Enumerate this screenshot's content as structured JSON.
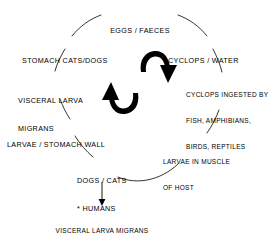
{
  "diagram": {
    "type": "cycle-diagram",
    "background_color": "#ffffff",
    "ink_color": "#000000",
    "nodes": [
      {
        "id": "eggs-faeces",
        "label": "EGGS / FAECES",
        "lines": [
          "EGGS / FAECES"
        ],
        "position": "top-center"
      },
      {
        "id": "cyclops-water",
        "label": "CYCLOPS / WATER",
        "lines": [
          "CYCLOPS / WATER"
        ],
        "position": "upper-right"
      },
      {
        "id": "cyclops-ingested",
        "label": "CYCLOPS INGESTED BY FISH, AMPHIBIANS, BIRDS, REPTILES",
        "lines": [
          "CYCLOPS INGESTED BY",
          "FISH, AMPHIBIANS,",
          "BIRDS, REPTILES"
        ],
        "position": "right"
      },
      {
        "id": "larvae-muscle",
        "label": "LARVAE IN MUSCLE OF HOST",
        "lines": [
          "LARVAE IN MUSCLE",
          "OF HOST"
        ],
        "position": "lower-right"
      },
      {
        "id": "dogs-cats-humans",
        "label": "DOGS / CATS * HUMANS",
        "lines": [
          "DOGS / CATS",
          "* HUMANS"
        ],
        "position": "bottom-center"
      },
      {
        "id": "larvae-stomach-wall",
        "label": "LARVAE / STOMACH WALL",
        "lines": [
          "LARVAE / STOMACH WALL"
        ],
        "position": "lower-left"
      },
      {
        "id": "visceral-larva-migrans",
        "label": "VISCERAL LARVA MIGRANS",
        "lines": [
          "VISCERAL LARVA",
          "MIGRANS"
        ],
        "position": "left"
      },
      {
        "id": "stomach-cats-dogs",
        "label": "STOMACH CATS/DOGS",
        "lines": [
          "STOMACH CATS/DOGS"
        ],
        "position": "upper-left"
      }
    ],
    "outcome": {
      "id": "dead-end-outcome",
      "lines": [
        "VISCERAL LARVA MIGRANS",
        "* \"DEAD END\""
      ],
      "line1": "VISCERAL LARVA MIGRANS",
      "line2": "* \"DEAD END\"",
      "position": "below-bottom-center"
    },
    "rotation_arrows": {
      "name": "cycle-rotation-arrows",
      "count": 2,
      "upper": "curved-arrow-down-right",
      "lower": "curved-arrow-up-left",
      "direction": "clockwise"
    },
    "outcome_arrow": {
      "name": "dead-end-arrow",
      "direction": "down"
    }
  }
}
